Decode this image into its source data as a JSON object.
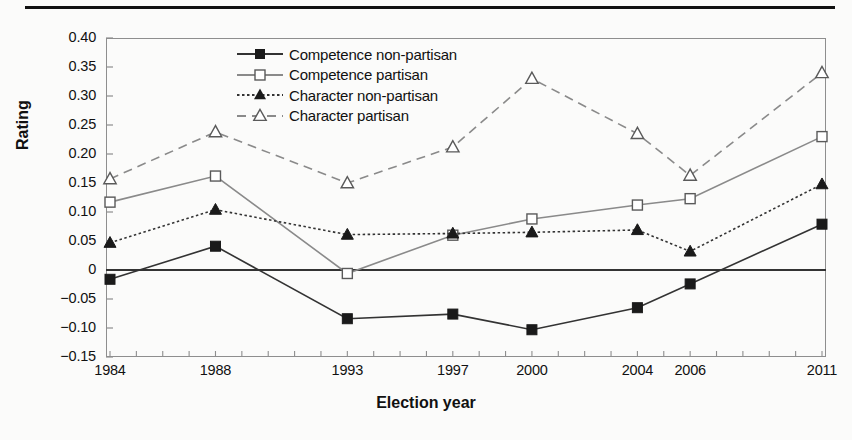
{
  "chart_data": {
    "type": "line",
    "title": "",
    "xlabel": "Election year",
    "ylabel": "Rating",
    "x": [
      1984,
      1988,
      1993,
      1997,
      2000,
      2004,
      2006,
      2011
    ],
    "xtick_labels": [
      "1984",
      "1988",
      "1993",
      "1997",
      "2000",
      "2004",
      "2006",
      "2011"
    ],
    "ytick_labels": [
      "0.40",
      "0.35",
      "0.30",
      "0.25",
      "0.20",
      "0.15",
      "0.10",
      "0.05",
      "0",
      "−0.05",
      "−0.10",
      "−0.15"
    ],
    "ytick_values": [
      0.4,
      0.35,
      0.3,
      0.25,
      0.2,
      0.15,
      0.1,
      0.05,
      0,
      -0.05,
      -0.1,
      -0.15
    ],
    "xlim": [
      1984,
      2011
    ],
    "ylim": [
      -0.15,
      0.4
    ],
    "grid": false,
    "zero_line": true,
    "legend_position": "top-center-inside",
    "series": [
      {
        "name": "Competence non-partisan",
        "marker": "filled-square",
        "line": "solid",
        "color": "#333333",
        "values": [
          -0.016,
          0.041,
          -0.084,
          -0.076,
          -0.103,
          -0.065,
          -0.024,
          0.079
        ]
      },
      {
        "name": "Competence partisan",
        "marker": "open-square",
        "line": "solid",
        "color": "#8a8a8a",
        "values": [
          0.117,
          0.162,
          -0.006,
          0.06,
          0.088,
          0.112,
          0.123,
          0.23
        ]
      },
      {
        "name": "Character non-partisan",
        "marker": "filled-triangle",
        "line": "dotted",
        "color": "#333333",
        "values": [
          0.047,
          0.104,
          0.061,
          0.063,
          0.065,
          0.069,
          0.032,
          0.148
        ]
      },
      {
        "name": "Character partisan",
        "marker": "open-triangle",
        "line": "dashed",
        "color": "#8a8a8a",
        "values": [
          0.157,
          0.238,
          0.15,
          0.212,
          0.33,
          0.235,
          0.163,
          0.34
        ]
      }
    ]
  }
}
